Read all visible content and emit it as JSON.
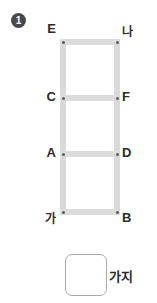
{
  "question": {
    "number": "1"
  },
  "diagram": {
    "type": "ladder-graph",
    "vertices": [
      {
        "id": "E",
        "label": "E",
        "side": "left",
        "row": "top"
      },
      {
        "id": "NA",
        "label": "나",
        "side": "right",
        "row": "top"
      },
      {
        "id": "C",
        "label": "C",
        "side": "left",
        "row": "second"
      },
      {
        "id": "F",
        "label": "F",
        "side": "right",
        "row": "second"
      },
      {
        "id": "A",
        "label": "A",
        "side": "left",
        "row": "third"
      },
      {
        "id": "D",
        "label": "D",
        "side": "right",
        "row": "third"
      },
      {
        "id": "GA",
        "label": "가",
        "side": "left",
        "row": "bottom"
      },
      {
        "id": "B",
        "label": "B",
        "side": "right",
        "row": "bottom"
      }
    ],
    "rails": [
      {
        "id": "rail-left",
        "from": "E",
        "to": "GA"
      },
      {
        "id": "rail-right",
        "from": "나",
        "to": "B"
      }
    ],
    "rungs": [
      {
        "id": "rung-top",
        "from": "E",
        "to": "나"
      },
      {
        "id": "rung-cf",
        "from": "C",
        "to": "F"
      },
      {
        "id": "rung-ad",
        "from": "A",
        "to": "D"
      },
      {
        "id": "rung-bottom",
        "from": "가",
        "to": "B"
      }
    ],
    "colors": {
      "rail": "#d9d9d9",
      "rung": "#dcdcdc",
      "node": "#5a5a5a",
      "label": "#2b2b2b"
    }
  },
  "answer": {
    "value": "",
    "placeholder": "",
    "unit": "가지"
  }
}
